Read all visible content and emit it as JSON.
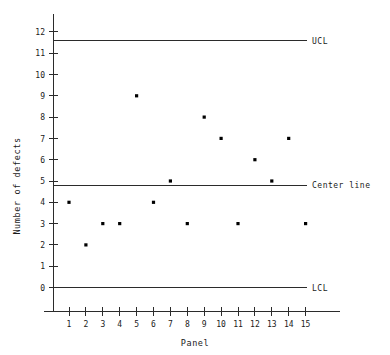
{
  "chart_data": {
    "type": "scatter",
    "title": "",
    "subtitle": "",
    "xlabel": "Panel",
    "ylabel": "Number of defects",
    "x": [
      1,
      2,
      3,
      4,
      5,
      6,
      7,
      8,
      9,
      10,
      11,
      12,
      13,
      14,
      15
    ],
    "categories": [
      "1",
      "2",
      "3",
      "4",
      "5",
      "6",
      "7",
      "8",
      "9",
      "10",
      "11",
      "12",
      "13",
      "14",
      "15"
    ],
    "values": [
      4,
      2,
      3,
      3,
      9,
      4,
      5,
      3,
      8,
      7,
      3,
      6,
      5,
      7,
      3
    ],
    "series": [
      {
        "name": "Number of defects",
        "values": [
          4,
          2,
          3,
          3,
          9,
          4,
          5,
          3,
          8,
          7,
          3,
          6,
          5,
          7,
          3
        ]
      }
    ],
    "xlim": [
      0.4,
      15.6
    ],
    "ylim": [
      0,
      12
    ],
    "xticks": [
      1,
      2,
      3,
      4,
      5,
      6,
      7,
      8,
      9,
      10,
      11,
      12,
      13,
      14,
      15
    ],
    "yticks": [
      0,
      1,
      2,
      3,
      4,
      5,
      6,
      7,
      8,
      9,
      10,
      11,
      12
    ],
    "ytick_labels": [
      "0",
      "1",
      "2",
      "3",
      "4",
      "5",
      "6",
      "7",
      "8",
      "9",
      "10",
      "11",
      "12"
    ],
    "grid": false,
    "legend_position": "right-inline",
    "marker": "square",
    "marker_color": "#000000",
    "line_color": "#2b2b2b",
    "control_limits": [
      {
        "name": "ucl",
        "label": "UCL",
        "value": 11.58
      },
      {
        "name": "center",
        "label": "Center line",
        "value": 4.8
      },
      {
        "name": "lcl",
        "label": "LCL",
        "value": 0
      }
    ],
    "annotations": [
      {
        "text": "UCL",
        "y": 11.58
      },
      {
        "text": "Center line",
        "y": 4.8
      },
      {
        "text": "LCL",
        "y": 0
      }
    ]
  },
  "axes": {
    "y_title": "Number of defects",
    "x_title": "Panel"
  }
}
